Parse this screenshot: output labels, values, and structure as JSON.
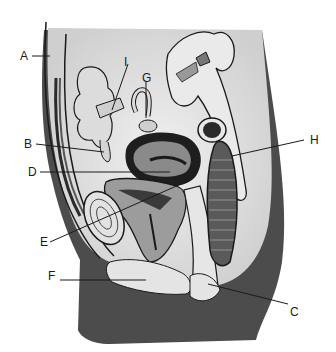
{
  "diagram": {
    "type": "anatomical-illustration",
    "colors": {
      "background": "#ffffff",
      "skin_dark": "#4a4a4a",
      "tissue_light": "#e6e6e6",
      "tissue_mid": "#bdbdbd",
      "outline": "#1a1a1a"
    },
    "labels": [
      {
        "id": "A",
        "text": "A",
        "x": 20,
        "y": 50
      },
      {
        "id": "I",
        "text": "I",
        "x": 124,
        "y": 56
      },
      {
        "id": "G",
        "text": "G",
        "x": 142,
        "y": 72
      },
      {
        "id": "H",
        "text": "H",
        "x": 310,
        "y": 134
      },
      {
        "id": "B",
        "text": "B",
        "x": 24,
        "y": 138
      },
      {
        "id": "D",
        "text": "D",
        "x": 28,
        "y": 166
      },
      {
        "id": "E",
        "text": "E",
        "x": 40,
        "y": 236
      },
      {
        "id": "F",
        "text": "F",
        "x": 48,
        "y": 270
      },
      {
        "id": "C",
        "text": "C",
        "x": 290,
        "y": 306
      }
    ]
  }
}
